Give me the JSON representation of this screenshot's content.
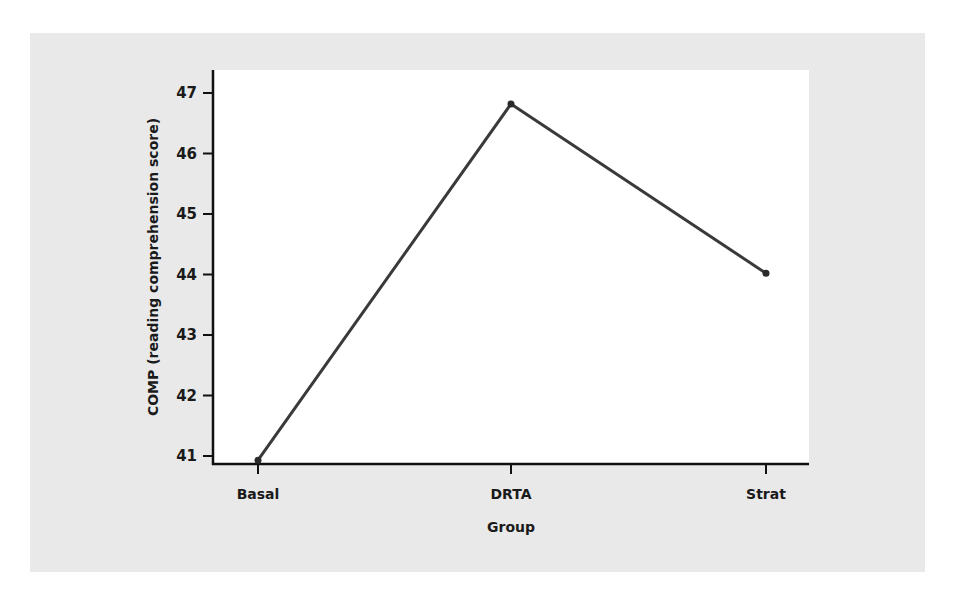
{
  "chart_data": {
    "type": "line",
    "title": "",
    "xlabel": "Group",
    "ylabel": "COMP (reading comprehension score)",
    "categories": [
      "Basal",
      "DRTA",
      "Strat"
    ],
    "series": [
      {
        "name": "COMP",
        "values": [
          40.93,
          46.82,
          44.02
        ]
      }
    ],
    "yticks": [
      41,
      42,
      43,
      44,
      45,
      46,
      47
    ],
    "ylim": [
      40.87,
      47.4
    ],
    "grid": false,
    "legend": null,
    "colors": {
      "line": "#3a3a3a",
      "panel": "#e9e9e9",
      "plot": "#ffffff",
      "axis": "#111111"
    }
  }
}
